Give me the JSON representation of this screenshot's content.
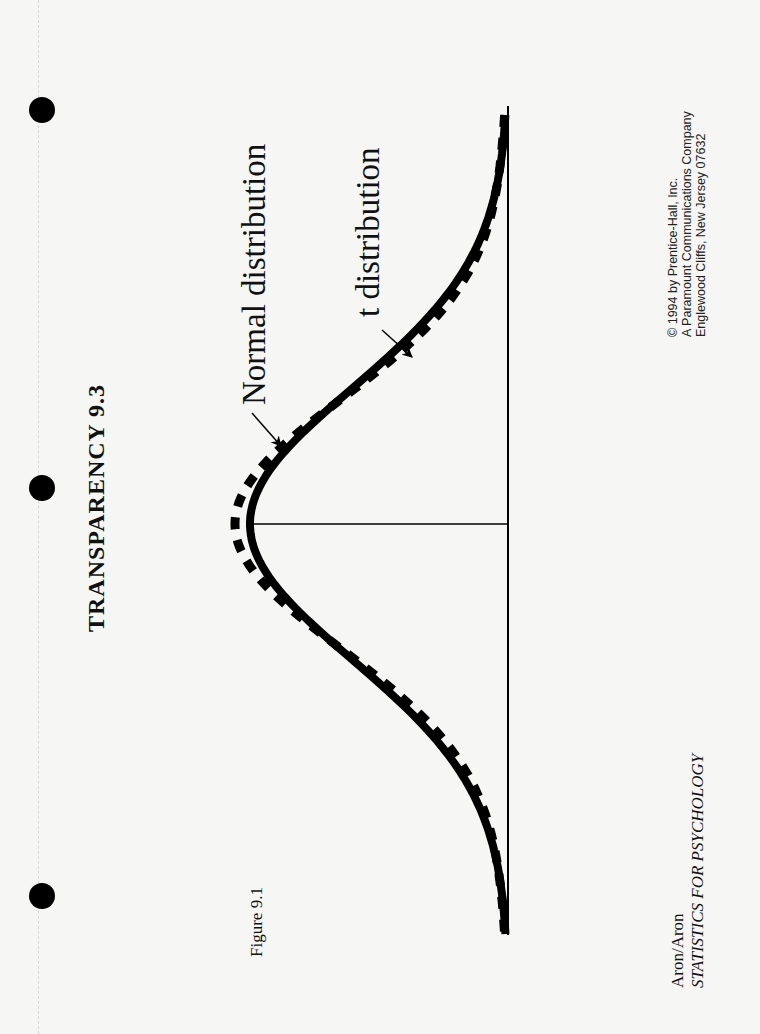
{
  "document": {
    "title": "TRANSPARENCY  9.3",
    "figure_label": "Figure 9.1",
    "author": "Aron/Aron",
    "book_title": "STATISTICS FOR PSYCHOLOGY",
    "copyright_lines": [
      "© 1994 by Prentice-Hall, Inc.",
      "A Paramount Communications Company",
      "Englewood Cliffs, New Jersey 07632"
    ],
    "orientation": "landscape (rotated 90° counter-clockwise)",
    "binder_holes": 3
  },
  "figure": {
    "labels": {
      "normal": "Normal distribution",
      "t": "t distribution"
    },
    "legend": [
      {
        "name": "Normal distribution",
        "style": "solid thick line",
        "color": "#000000"
      },
      {
        "name": "t distribution",
        "style": "dashed thick line",
        "color": "#000000"
      }
    ],
    "axis": {
      "horizontal_baseline": true,
      "center_line_at_mean": true,
      "ticks": "none"
    }
  },
  "chart_data": {
    "type": "line",
    "title": "Figure 9.1",
    "xlabel": "",
    "ylabel": "",
    "x_range": [
      -3.5,
      3.5
    ],
    "series": [
      {
        "name": "Normal distribution",
        "style": "solid",
        "description": "standard normal curve, peak at mean"
      },
      {
        "name": "t distribution",
        "style": "dashed",
        "description": "t curve drawn closely following the normal curve, slightly higher at center and closer to baseline in mid tails"
      }
    ],
    "annotations": [
      {
        "text": "Normal distribution",
        "arrow_to": "solid curve left shoulder"
      },
      {
        "text": "t distribution",
        "arrow_to": "dashed curve right slope"
      }
    ],
    "grid": false
  }
}
